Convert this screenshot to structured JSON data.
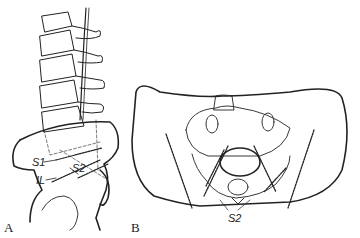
{
  "figure": {
    "panels": [
      {
        "id": "A",
        "label": "A",
        "view": "lateral lumbosacral spine and pelvis"
      },
      {
        "id": "B",
        "label": "B",
        "view": "pelvis frontal/axial view"
      }
    ],
    "annotations": {
      "s1": "S1",
      "il": "IL",
      "s2_a": "S2",
      "s2_b": "S2"
    },
    "colors": {
      "ink": "#222222",
      "background": "#ffffff"
    }
  }
}
